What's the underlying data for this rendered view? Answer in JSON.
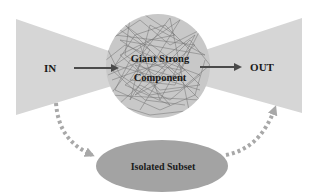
{
  "diagram": {
    "type": "bow-tie network structure",
    "nodes": {
      "in": {
        "label": "IN"
      },
      "core": {
        "label_line1": "Giant Strong",
        "label_line2": "Component"
      },
      "out": {
        "label": "OUT"
      },
      "isolated": {
        "label": "Isolated Subset"
      }
    },
    "edges": [
      {
        "from": "IN",
        "to": "Giant Strong Component",
        "style": "solid"
      },
      {
        "from": "Giant Strong Component",
        "to": "OUT",
        "style": "solid"
      },
      {
        "from": "IN",
        "to": "Isolated Subset",
        "style": "dotted"
      },
      {
        "from": "Isolated Subset",
        "to": "OUT",
        "style": "dotted"
      }
    ],
    "colors": {
      "wedge": "#d6d6d6",
      "core": "#c8c8c8",
      "isolated": "#a3a3a3",
      "solid_arrow": "#4a4a4a",
      "dotted_arrow": "#a8a8a8",
      "text": "#1a1a1a"
    }
  }
}
